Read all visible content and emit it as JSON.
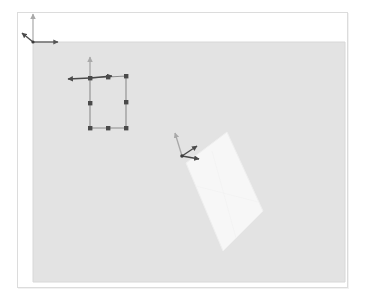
{
  "app": {
    "title": "3D Viewport",
    "kind": "3d-scene-editor"
  },
  "viewport": {
    "background_color": "#ffffff",
    "border_color": "#dcdcdc",
    "frame": {
      "x": 17,
      "y": 12,
      "width": 331,
      "height": 276
    }
  },
  "ground_plane": {
    "name": "ground-plane",
    "fill_color": "#e3e3e3",
    "edge_color": "#d8d8d8",
    "corners": [
      {
        "x": 33,
        "y": 42
      },
      {
        "x": 345,
        "y": 42
      },
      {
        "x": 345,
        "y": 282
      },
      {
        "x": 33,
        "y": 282
      }
    ]
  },
  "world_gizmo": {
    "name": "world-origin-gizmo",
    "origin": {
      "x": 33,
      "y": 42
    },
    "axes": [
      {
        "label": "y-axis",
        "color": "#a9a9a9",
        "tip": {
          "x": 33,
          "y": 11
        }
      },
      {
        "label": "x-axis",
        "color": "#555555",
        "tip": {
          "x": 60,
          "y": 42
        }
      },
      {
        "label": "z-axis",
        "color": "#4a4a4a",
        "tip": {
          "x": 22,
          "y": 34
        }
      }
    ]
  },
  "wireframe_rect": {
    "name": "selected-rectangle",
    "edge_color": "#8e8e8e",
    "handle_color": "#4a4a4a",
    "handle_size": 4,
    "corners": [
      {
        "x": 90,
        "y": 78
      },
      {
        "x": 126,
        "y": 76
      },
      {
        "x": 126,
        "y": 128
      },
      {
        "x": 90,
        "y": 128
      }
    ],
    "handles": [
      {
        "name": "handle-top-left",
        "x": 90,
        "y": 78
      },
      {
        "name": "handle-top-mid",
        "x": 108,
        "y": 77
      },
      {
        "name": "handle-top-right",
        "x": 126,
        "y": 76
      },
      {
        "name": "handle-right-mid",
        "x": 126,
        "y": 102
      },
      {
        "name": "handle-bottom-right",
        "x": 126,
        "y": 128
      },
      {
        "name": "handle-bottom-mid",
        "x": 108,
        "y": 128
      },
      {
        "name": "handle-bottom-left",
        "x": 90,
        "y": 128
      },
      {
        "name": "handle-left-mid",
        "x": 90,
        "y": 103
      }
    ]
  },
  "rect_gizmo": {
    "name": "rectangle-transform-gizmo",
    "origin": {
      "x": 90,
      "y": 78
    },
    "axes": [
      {
        "label": "y-axis",
        "color": "#a3a3a3",
        "tip": {
          "x": 90,
          "y": 55
        }
      },
      {
        "label": "x-axis",
        "color": "#4a4a4a",
        "tip": {
          "x": 114,
          "y": 76
        }
      },
      {
        "label": "z-axis",
        "color": "#4a4a4a",
        "tip": {
          "x": 66,
          "y": 79
        }
      }
    ]
  },
  "tilted_quad": {
    "name": "tilted-plane",
    "fill_color": "#f7f7f7",
    "edge_color": "#efefef",
    "corners": [
      {
        "x": 227,
        "y": 132
      },
      {
        "x": 263,
        "y": 211
      },
      {
        "x": 223,
        "y": 251
      },
      {
        "x": 186,
        "y": 163
      }
    ]
  },
  "quad_gizmo": {
    "name": "quad-transform-gizmo",
    "origin": {
      "x": 182,
      "y": 156
    },
    "axes": [
      {
        "label": "y-axis",
        "color": "#a3a3a3",
        "tip": {
          "x": 175,
          "y": 131
        }
      },
      {
        "label": "x-axis",
        "color": "#4a4a4a",
        "tip": {
          "x": 200,
          "y": 157
        }
      },
      {
        "label": "z-axis",
        "color": "#4a4a4a",
        "tip": {
          "x": 198,
          "y": 147
        }
      }
    ]
  }
}
